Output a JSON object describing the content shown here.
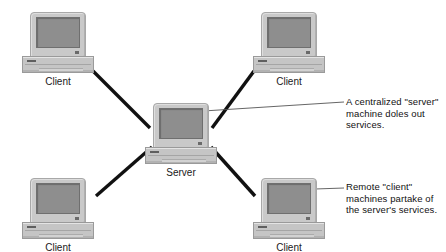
{
  "diagram": {
    "background_color": "#ffffff",
    "wire_color": "#111111",
    "callout_line_color": "#4a4a4a",
    "nodes": [
      {
        "id": "client-top-left",
        "label": "Client",
        "role": "client",
        "x": 22,
        "y": 12
      },
      {
        "id": "client-top-right",
        "label": "Client",
        "role": "client",
        "x": 253,
        "y": 12
      },
      {
        "id": "server-center",
        "label": "Server",
        "role": "server",
        "x": 145,
        "y": 103
      },
      {
        "id": "client-bottom-left",
        "label": "Client",
        "role": "client",
        "x": 22,
        "y": 178
      },
      {
        "id": "client-bottom-right",
        "label": "Client",
        "role": "client",
        "x": 253,
        "y": 178
      }
    ],
    "connections": [
      {
        "from": "client-top-left",
        "to": "server-center"
      },
      {
        "from": "client-top-right",
        "to": "server-center"
      },
      {
        "from": "client-bottom-left",
        "to": "server-center"
      },
      {
        "from": "client-bottom-right",
        "to": "server-center"
      }
    ],
    "annotations": [
      {
        "id": "server-annotation",
        "text": "A centralized \"server\"\nmachine doles out\nservices.",
        "target": "server-center",
        "x": 346,
        "y": 96
      },
      {
        "id": "client-annotation",
        "text": "Remote \"client\"\nmachines partake of\nthe server's services.",
        "target": "client-bottom-right",
        "x": 346,
        "y": 181
      }
    ]
  }
}
